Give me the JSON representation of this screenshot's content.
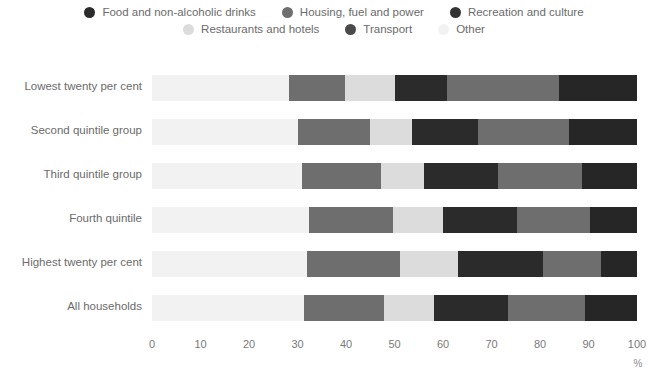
{
  "legend": {
    "rows": [
      [
        {
          "label": "Food and non-alcoholic drinks",
          "color": "#2b2b2b",
          "icon": "legend-dot-icon"
        },
        {
          "label": "Housing, fuel and power",
          "color": "#6e6e6e",
          "icon": "legend-dot-icon"
        },
        {
          "label": "Recreation and culture",
          "color": "#343434",
          "icon": "legend-dot-icon"
        }
      ],
      [
        {
          "label": "Restaurants and hotels",
          "color": "#dcdcdc",
          "icon": "legend-dot-icon"
        },
        {
          "label": "Transport",
          "color": "#4a4a4a",
          "icon": "legend-dot-icon"
        },
        {
          "label": "Other",
          "color": "#f2f2f2",
          "icon": "legend-dot-icon"
        }
      ]
    ]
  },
  "axis": {
    "ticks": [
      "0",
      "10",
      "20",
      "30",
      "40",
      "50",
      "60",
      "70",
      "80",
      "90",
      "100"
    ],
    "unit": "%"
  },
  "chart_data": {
    "type": "bar",
    "orientation": "horizontal",
    "stacked": true,
    "normalized": true,
    "title": "",
    "xlabel": "%",
    "ylabel": "",
    "xlim": [
      0,
      100
    ],
    "grid": false,
    "legend_position": "top",
    "categories": [
      "Lowest twenty per cent",
      "Second quintile group",
      "Third quintile group",
      "Fourth quintile",
      "Highest twenty per cent",
      "All households"
    ],
    "series": [
      {
        "name": "Other",
        "color": "#f2f2f2",
        "values": [
          28.2,
          30.1,
          30.9,
          32.4,
          32.0,
          31.3
        ]
      },
      {
        "name": "Housing, fuel and power",
        "color": "#6e6e6e",
        "values": [
          11.6,
          14.8,
          16.3,
          17.2,
          19.1,
          16.5
        ]
      },
      {
        "name": "Restaurants and hotels",
        "color": "#dcdcdc",
        "values": [
          10.3,
          8.7,
          8.9,
          10.4,
          12.0,
          10.3
        ]
      },
      {
        "name": "Food and non-alcoholic drinks",
        "color": "#2b2b2b",
        "values": [
          10.7,
          13.6,
          15.2,
          15.2,
          17.5,
          15.3
        ]
      },
      {
        "name": "Transport",
        "color": "#6e6e6e",
        "values": [
          23.1,
          18.8,
          17.4,
          15.1,
          12.0,
          15.9
        ]
      },
      {
        "name": "Recreation and culture",
        "color": "#262626",
        "values": [
          16.1,
          14.0,
          11.3,
          9.7,
          7.4,
          10.7
        ]
      }
    ]
  }
}
